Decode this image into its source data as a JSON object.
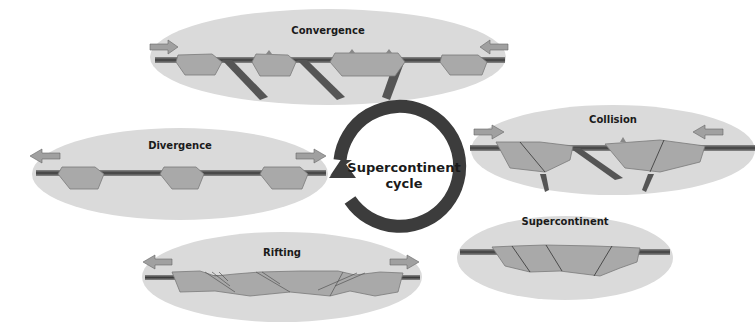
{
  "diagram": {
    "title": "Supercontinent cycle",
    "center_label_line1": "Supercontinent",
    "center_label_line2": "cycle",
    "stages": [
      {
        "id": "convergence",
        "label": "Convergence",
        "arrows": "inward"
      },
      {
        "id": "collision",
        "label": "Collision",
        "arrows": "inward"
      },
      {
        "id": "supercontinent",
        "label": "Supercontinent",
        "arrows": "none"
      },
      {
        "id": "rifting",
        "label": "Rifting",
        "arrows": "outward"
      },
      {
        "id": "divergence",
        "label": "Divergence",
        "arrows": "outward"
      }
    ],
    "cycle_direction": "clockwise",
    "colors": {
      "ellipse": "#d9d9d9",
      "continent": "#a9a9a9",
      "continent_edge": "#7a7a7a",
      "oceanic_plate": "#555555",
      "arrow_fill": "#a0a0a0",
      "cycle_arrow": "#3c3c3c"
    }
  }
}
